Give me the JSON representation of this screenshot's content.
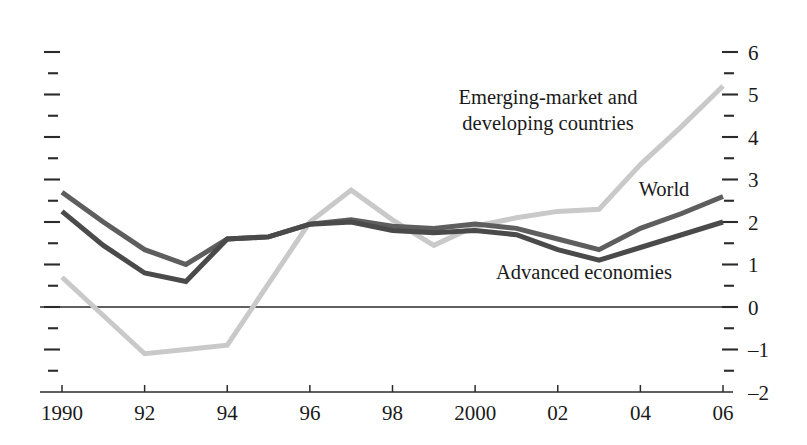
{
  "chart_data": {
    "type": "line",
    "title": "",
    "subtitle": "",
    "xlabel": "",
    "ylabel": "",
    "xlim": [
      1990,
      2006
    ],
    "ylim": [
      -2,
      6
    ],
    "grid": false,
    "legend_position": "inline-annotations",
    "zero_line": true,
    "x": [
      1990,
      1991,
      1992,
      1993,
      1994,
      1995,
      1996,
      1997,
      1998,
      1999,
      2000,
      2001,
      2002,
      2003,
      2004,
      2005,
      2006
    ],
    "xtick_labels": [
      "1990",
      "92",
      "94",
      "96",
      "98",
      "2000",
      "02",
      "04",
      "06"
    ],
    "xtick_values": [
      1990,
      1992,
      1994,
      1996,
      1998,
      2000,
      2002,
      2004,
      2006
    ],
    "ytick_labels": [
      "6",
      "5",
      "4",
      "3",
      "2",
      "1",
      "0",
      "-1",
      "-2"
    ],
    "ytick_values": [
      6,
      5,
      4,
      3,
      2,
      1,
      0,
      -1,
      -2
    ],
    "yminor_values": [
      5.5,
      4.5,
      3.5,
      2.5,
      1.5,
      0.5,
      -0.5,
      -1.5
    ],
    "series": [
      {
        "name": "Emerging-market and developing countries",
        "color": "#c9c9c9",
        "width": 5.0,
        "label_text": [
          "Emerging-market and",
          "developing countries"
        ],
        "values": [
          0.7,
          -0.2,
          -1.1,
          -1.0,
          -0.9,
          0.55,
          2.0,
          2.75,
          2.05,
          1.45,
          1.9,
          2.1,
          2.25,
          2.3,
          3.35,
          4.25,
          5.2
        ]
      },
      {
        "name": "World",
        "color": "#5e5e5e",
        "width": 5.0,
        "label_text": [
          "World"
        ],
        "values": [
          2.7,
          2.0,
          1.35,
          1.0,
          1.6,
          1.65,
          1.95,
          2.05,
          1.9,
          1.85,
          1.95,
          1.85,
          1.6,
          1.35,
          1.85,
          2.2,
          2.6
        ]
      },
      {
        "name": "Advanced economies",
        "color": "#4a4a4a",
        "width": 5.0,
        "label_text": [
          "Advanced economies"
        ],
        "values": [
          2.25,
          1.45,
          0.8,
          0.6,
          1.6,
          1.65,
          1.95,
          2.0,
          1.8,
          1.75,
          1.8,
          1.7,
          1.35,
          1.1,
          1.4,
          1.7,
          2.0
        ]
      }
    ],
    "annotations": [
      {
        "name": "emerging-label",
        "lines": [
          "Emerging-market and",
          "developing countries"
        ],
        "x": 548,
        "y": 104
      },
      {
        "name": "world-label",
        "lines": [
          "World"
        ],
        "x": 664,
        "y": 196
      },
      {
        "name": "advanced-label",
        "lines": [
          "Advanced economies"
        ],
        "x": 584,
        "y": 279
      }
    ]
  }
}
